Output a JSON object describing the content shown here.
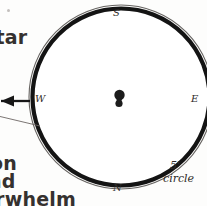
{
  "figure": {
    "type": "astronomical-finder-chart",
    "field_circle": {
      "scale_value": "5'",
      "scale_word": "circle"
    },
    "compass": {
      "top": "S",
      "bottom": "N",
      "left": "W",
      "right": "E"
    },
    "center_object": {
      "name": "double-star-marker",
      "components": 2
    }
  },
  "margin_text": {
    "line_star": "star",
    "line_dash": "-",
    "line_s": "s",
    "line_on": "on",
    "line_nd": "nd",
    "line_whelm": "erwhelm"
  },
  "colors": {
    "ink": "#1a1a1a",
    "paper": "#fdfdfc",
    "text": "#35312f"
  }
}
